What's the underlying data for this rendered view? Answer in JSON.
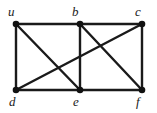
{
  "figure": {
    "name": "undirected-graph-diagram",
    "background_color": "#ffffff",
    "edge_color": "#1a1a1a",
    "vertex_color": "#111111",
    "label_color": "#1a1a1a"
  },
  "graph_data": {
    "type": "graph",
    "directed": false,
    "vertex_count": 6,
    "edge_count": 10,
    "vertices": [
      {
        "id": "u",
        "label": "u",
        "x": 16,
        "y": 24,
        "label_x": 8,
        "label_y": 5,
        "row": "top"
      },
      {
        "id": "b",
        "label": "b",
        "x": 80,
        "y": 24,
        "label_x": 72,
        "label_y": 5,
        "row": "top"
      },
      {
        "id": "c",
        "label": "c",
        "x": 142,
        "y": 24,
        "label_x": 135,
        "label_y": 5,
        "row": "top"
      },
      {
        "id": "d",
        "label": "d",
        "x": 16,
        "y": 90,
        "label_x": 9,
        "label_y": 95,
        "row": "bottom"
      },
      {
        "id": "e",
        "label": "e",
        "x": 80,
        "y": 90,
        "label_x": 73,
        "label_y": 95,
        "row": "bottom"
      },
      {
        "id": "f",
        "label": "f",
        "x": 142,
        "y": 90,
        "label_x": 136,
        "label_y": 95,
        "row": "bottom"
      }
    ],
    "edges": [
      {
        "id": "u-b",
        "from": "u",
        "to": "b",
        "kind": "top-horizontal"
      },
      {
        "id": "b-c",
        "from": "b",
        "to": "c",
        "kind": "top-horizontal"
      },
      {
        "id": "u-d",
        "from": "u",
        "to": "d",
        "kind": "left-vertical"
      },
      {
        "id": "b-e",
        "from": "b",
        "to": "e",
        "kind": "middle-vertical"
      },
      {
        "id": "c-f",
        "from": "c",
        "to": "f",
        "kind": "right-vertical"
      },
      {
        "id": "d-e",
        "from": "d",
        "to": "e",
        "kind": "bottom-horizontal"
      },
      {
        "id": "e-f",
        "from": "e",
        "to": "f",
        "kind": "bottom-horizontal"
      },
      {
        "id": "u-e",
        "from": "u",
        "to": "e",
        "kind": "diagonal"
      },
      {
        "id": "d-c",
        "from": "d",
        "to": "c",
        "kind": "diagonal"
      },
      {
        "id": "b-f",
        "from": "b",
        "to": "f",
        "kind": "diagonal"
      }
    ]
  }
}
